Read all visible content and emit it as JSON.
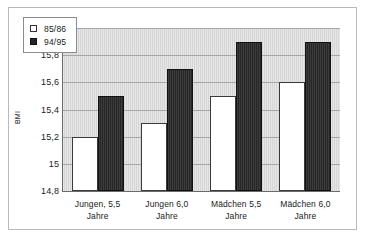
{
  "chart_data": {
    "type": "bar",
    "title": "",
    "xlabel": "",
    "ylabel": "BMI",
    "ylim": [
      14.8,
      16.0
    ],
    "yticks": [
      "14,8",
      "15",
      "15,2",
      "15,4",
      "15,6",
      "15,8",
      "16"
    ],
    "ytick_values": [
      14.8,
      15.0,
      15.2,
      15.4,
      15.6,
      15.8,
      16.0
    ],
    "grid": true,
    "legend_position": "top-left-inside",
    "categories": [
      "Jungen, 5,5 Jahre",
      "Jungen 6,0 Jahre",
      "Mädchen 5,5 Jahre",
      "Mädchen 6,0 Jahre"
    ],
    "category_lines": [
      [
        "Jungen, 5,5",
        "Jahre"
      ],
      [
        "Jungen 6,0",
        "Jahre"
      ],
      [
        "Mädchen 5,5",
        "Jahre"
      ],
      [
        "Mädchen 6,0",
        "Jahre"
      ]
    ],
    "series": [
      {
        "name": "85/86",
        "color": "#ffffff",
        "values": [
          15.2,
          15.3,
          15.5,
          15.6
        ]
      },
      {
        "name": "94/95",
        "color": "#262626",
        "values": [
          15.5,
          15.7,
          15.9,
          15.9
        ]
      }
    ]
  },
  "legend": {
    "items": [
      {
        "label": "85/86",
        "swatch": "hollow-square-icon"
      },
      {
        "label": "94/95",
        "swatch": "filled-square-icon"
      }
    ]
  },
  "colors": {
    "plot_background": "#d6d6d6",
    "gridline": "#a6a6a6",
    "axis": "#6b6b6b",
    "frame": "#b9b9b9",
    "text": "#1b1b1b"
  }
}
